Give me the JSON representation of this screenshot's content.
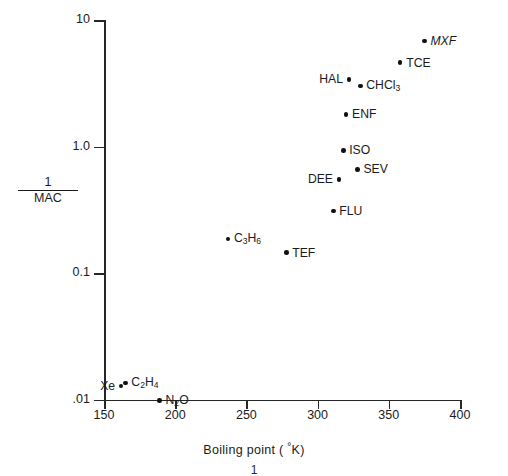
{
  "chart_data": {
    "type": "scatter",
    "title": "",
    "xlabel": "Boiling point (°K)",
    "ylabel": "1/MAC",
    "ylabel_numerator": "1",
    "ylabel_denominator": "MAC",
    "xscale": "linear",
    "yscale": "log",
    "xlim": [
      150,
      400
    ],
    "ylim": [
      0.01,
      10
    ],
    "grid": false,
    "legend": false,
    "xticks": [
      150,
      200,
      250,
      300,
      350,
      400
    ],
    "xtick_labels": [
      "150",
      "200",
      "250",
      "300",
      "350",
      "400"
    ],
    "yticks": [
      10,
      1.0,
      0.1,
      0.01
    ],
    "ytick_labels": [
      "10",
      "1.0",
      "0.1",
      ".01"
    ],
    "points": [
      {
        "label": "MXF",
        "x": 375,
        "y": 6.8,
        "label_side": "right",
        "italic": true,
        "html": "MXF"
      },
      {
        "label": "TCE",
        "x": 358,
        "y": 4.6,
        "label_side": "right",
        "italic": false,
        "html": "TCE"
      },
      {
        "label": "HAL",
        "x": 322,
        "y": 3.4,
        "label_side": "left",
        "italic": false,
        "html": "HAL"
      },
      {
        "label": "CHCl3",
        "x": 330,
        "y": 3.0,
        "label_side": "right",
        "italic": false,
        "html": "CHCl<sub>3</sub>"
      },
      {
        "label": "ENF",
        "x": 320,
        "y": 1.8,
        "label_side": "right",
        "italic": false,
        "html": "ENF"
      },
      {
        "label": "ISO",
        "x": 318,
        "y": 0.93,
        "label_side": "right",
        "italic": false,
        "html": "ISO"
      },
      {
        "label": "SEV",
        "x": 328,
        "y": 0.66,
        "label_side": "right",
        "italic": false,
        "html": "SEV"
      },
      {
        "label": "DEE",
        "x": 315,
        "y": 0.55,
        "label_side": "left",
        "italic": false,
        "html": "DEE"
      },
      {
        "label": "FLU",
        "x": 311,
        "y": 0.31,
        "label_side": "right",
        "italic": false,
        "html": "FLU"
      },
      {
        "label": "C3H6",
        "x": 237,
        "y": 0.185,
        "label_side": "right",
        "italic": false,
        "html": "C<sub>3</sub>H<sub>6</sub>"
      },
      {
        "label": "TEF",
        "x": 278,
        "y": 0.145,
        "label_side": "right",
        "italic": false,
        "html": "TEF"
      },
      {
        "label": "C2H4",
        "x": 165,
        "y": 0.0135,
        "label_side": "right",
        "italic": false,
        "html": "C<sub>2</sub>H<sub>4</sub>"
      },
      {
        "label": "Xe",
        "x": 162,
        "y": 0.0128,
        "label_side": "left",
        "italic": false,
        "html": "Xe"
      },
      {
        "label": "N2O",
        "x": 189,
        "y": 0.0098,
        "label_side": "right",
        "italic": false,
        "html": "N<sub>2</sub>O"
      }
    ]
  },
  "figure": {
    "caption_remnant": "1",
    "ink_color": "#1a1a1a",
    "point_color": "#101010",
    "background_color": "#ffffff"
  }
}
